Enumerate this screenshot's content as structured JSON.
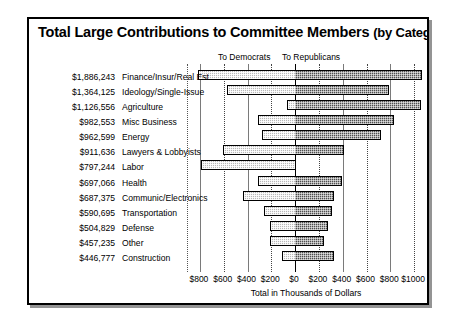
{
  "chart_data": {
    "type": "bar",
    "orientation": "horizontal-diverging",
    "title": "Total Large Contributions to Committee Members (by Category)",
    "title_main": "Total Large Contributions to Committee Members",
    "title_sub": "(by Category)",
    "xlabel": "Total in Thousands of Dollars",
    "ylabel": "",
    "xlim": [
      -900,
      1100
    ],
    "grid": true,
    "legend_position": "top",
    "series_headers": [
      "To Democrats",
      "To Republicans"
    ],
    "tick_labels": [
      "$800",
      "$600",
      "$400",
      "$200",
      "$0",
      "$200",
      "$400",
      "$600",
      "$800",
      "$1000"
    ],
    "tick_values": [
      -800,
      -600,
      -400,
      -200,
      0,
      200,
      400,
      600,
      800,
      1000
    ],
    "categories": [
      "Finance/Insur/Real Est",
      "Ideology/Single-Issue",
      "Agriculture",
      "Misc Business",
      "Energy",
      "Lawyers & Lobbyists",
      "Labor",
      "Health",
      "Communic/Electronics",
      "Transportation",
      "Defense",
      "Other",
      "Construction"
    ],
    "totals": [
      "$1,886,243",
      "$1,364,125",
      "$1,126,556",
      "$982,553",
      "$962,599",
      "$911,636",
      "$797,244",
      "$697,066",
      "$687,375",
      "$590,695",
      "$504,829",
      "$457,235",
      "$446,777"
    ],
    "series": [
      {
        "name": "To Democrats",
        "color": "#b9b9b9",
        "values": [
          -820,
          -570,
          -70,
          -310,
          -280,
          -610,
          -790,
          -310,
          -440,
          -260,
          -210,
          -210,
          -110
        ]
      },
      {
        "name": "To Republicans",
        "color": "#4f4f4f",
        "values": [
          1065,
          790,
          1055,
          830,
          720,
          410,
          10,
          390,
          330,
          310,
          280,
          240,
          330
        ]
      }
    ]
  }
}
